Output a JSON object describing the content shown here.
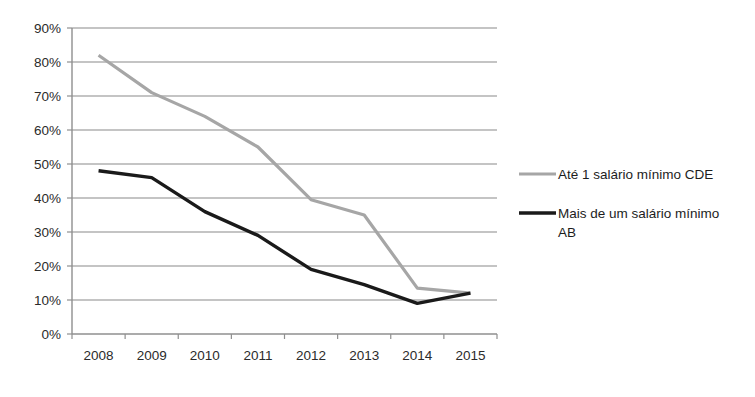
{
  "chart_data": {
    "type": "line",
    "title": "",
    "xlabel": "",
    "ylabel": "",
    "categories": [
      "2008",
      "2009",
      "2010",
      "2011",
      "2012",
      "2013",
      "2014",
      "2015"
    ],
    "ylim": [
      0,
      90
    ],
    "ytick_step": 10,
    "ytick_labels": [
      "0%",
      "10%",
      "20%",
      "30%",
      "40%",
      "50%",
      "60%",
      "70%",
      "80%",
      "90%"
    ],
    "ytick_values": [
      0,
      10,
      20,
      30,
      40,
      50,
      60,
      70,
      80,
      90
    ],
    "grid": "horizontal",
    "legend_position": "right",
    "value_suffix": "%",
    "series": [
      {
        "name": "Até 1 salário mínimo  CDE",
        "color": "#a6a6a6",
        "values": [
          82,
          71,
          64,
          55,
          39.5,
          35,
          13.5,
          12
        ]
      },
      {
        "name": "Mais de um salário mínimo AB",
        "color": "#1a1a1a",
        "values": [
          48,
          46,
          36,
          29,
          19,
          14.5,
          9,
          12
        ]
      }
    ]
  },
  "legend": {
    "items": [
      {
        "label": "Até 1 salário mínimo  CDE",
        "label_line2": "",
        "color": "#a6a6a6"
      },
      {
        "label": "Mais de um salário mínimo",
        "label_line2": "AB",
        "color": "#1a1a1a"
      }
    ]
  }
}
